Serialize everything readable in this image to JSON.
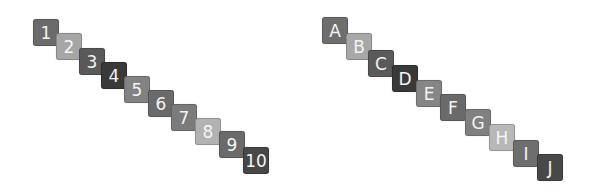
{
  "sequences": [
    {
      "name": "numbers",
      "tiles": [
        {
          "label": "1",
          "color": "#6b6b6b",
          "x": 33,
          "y": 19
        },
        {
          "label": "2",
          "color": "#a6a6a6",
          "x": 56,
          "y": 33
        },
        {
          "label": "3",
          "color": "#595959",
          "x": 79,
          "y": 48
        },
        {
          "label": "4",
          "color": "#393939",
          "x": 101,
          "y": 62
        },
        {
          "label": "5",
          "color": "#828282",
          "x": 124,
          "y": 76
        },
        {
          "label": "6",
          "color": "#6a6a6a",
          "x": 148,
          "y": 90
        },
        {
          "label": "7",
          "color": "#7b7b7b",
          "x": 171,
          "y": 104
        },
        {
          "label": "8",
          "color": "#b2b2b2",
          "x": 195,
          "y": 118
        },
        {
          "label": "9",
          "color": "#6a6a6a",
          "x": 219,
          "y": 131
        },
        {
          "label": "10",
          "color": "#474747",
          "x": 243,
          "y": 147
        }
      ]
    },
    {
      "name": "letters",
      "tiles": [
        {
          "label": "A",
          "color": "#6e6e6e",
          "x": 322,
          "y": 17
        },
        {
          "label": "B",
          "color": "#a8a8a8",
          "x": 346,
          "y": 33
        },
        {
          "label": "C",
          "color": "#5a5a5a",
          "x": 368,
          "y": 50
        },
        {
          "label": "D",
          "color": "#393939",
          "x": 392,
          "y": 65
        },
        {
          "label": "E",
          "color": "#868686",
          "x": 416,
          "y": 80
        },
        {
          "label": "F",
          "color": "#6a6a6a",
          "x": 440,
          "y": 94
        },
        {
          "label": "G",
          "color": "#808080",
          "x": 465,
          "y": 109
        },
        {
          "label": "H",
          "color": "#b8b8b8",
          "x": 489,
          "y": 124
        },
        {
          "label": "I",
          "color": "#6e6e6e",
          "x": 513,
          "y": 140
        },
        {
          "label": "J",
          "color": "#484848",
          "x": 537,
          "y": 154
        }
      ]
    }
  ]
}
